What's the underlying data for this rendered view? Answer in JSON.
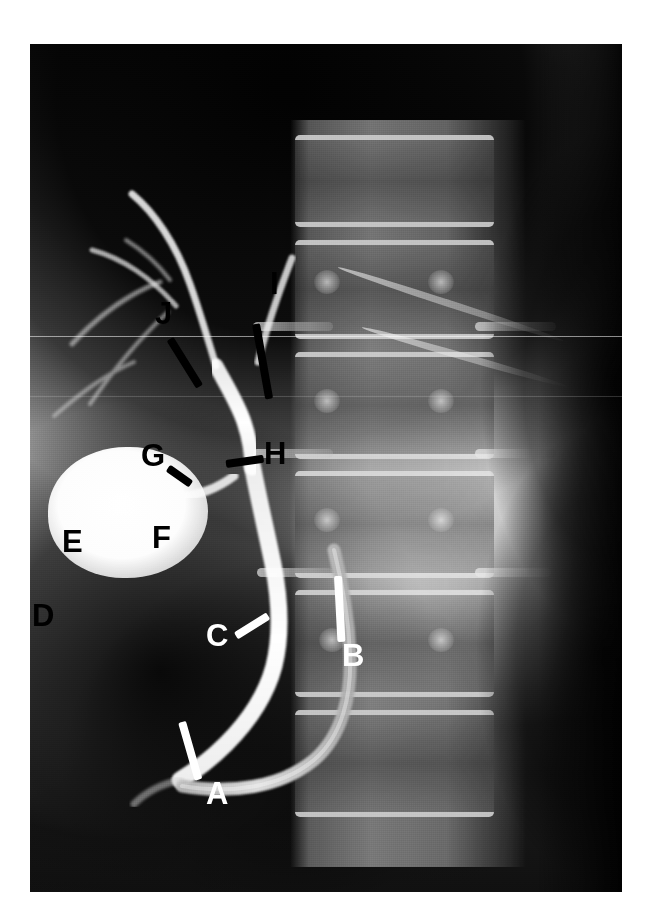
{
  "image": {
    "modality": "ERCP cholangiogram radiograph",
    "orientation": "AP",
    "background_color": "#ffffff",
    "plate_color": "#0a0a0a"
  },
  "annotations": {
    "black_marker_color": "#000000",
    "white_marker_color": "#ffffff",
    "labels": [
      {
        "id": "A",
        "text": "A",
        "color": "white",
        "x": 206,
        "y": 780,
        "leader": true,
        "leader_color": "white"
      },
      {
        "id": "B",
        "text": "B",
        "color": "white",
        "x": 342,
        "y": 650,
        "leader": true,
        "leader_color": "white"
      },
      {
        "id": "C",
        "text": "C",
        "color": "white",
        "x": 206,
        "y": 632,
        "leader": true,
        "leader_color": "white"
      },
      {
        "id": "D",
        "text": "D",
        "color": "black",
        "x": 32,
        "y": 614,
        "leader": false,
        "leader_color": "black"
      },
      {
        "id": "E",
        "text": "E",
        "color": "black",
        "x": 62,
        "y": 543,
        "leader": false,
        "leader_color": "black"
      },
      {
        "id": "F",
        "text": "F",
        "color": "black",
        "x": 152,
        "y": 538,
        "leader": false,
        "leader_color": "black"
      },
      {
        "id": "G",
        "text": "G",
        "color": "black",
        "x": 141,
        "y": 455,
        "leader": true,
        "leader_color": "black"
      },
      {
        "id": "H",
        "text": "H",
        "color": "black",
        "x": 264,
        "y": 452,
        "leader": true,
        "leader_color": "black"
      },
      {
        "id": "I",
        "text": "I",
        "color": "black",
        "x": 270,
        "y": 283,
        "leader": true,
        "leader_color": "black"
      },
      {
        "id": "J",
        "text": "J",
        "color": "black",
        "x": 155,
        "y": 313,
        "leader": true,
        "leader_color": "black"
      }
    ]
  },
  "anatomy": {
    "structures": [
      "gallbladder",
      "cystic duct",
      "common bile duct",
      "common hepatic duct",
      "right hepatic duct",
      "left hepatic duct",
      "intrahepatic radicles",
      "duodenoscope",
      "duodenum",
      "lumbar vertebral bodies",
      "bowel gas"
    ]
  }
}
